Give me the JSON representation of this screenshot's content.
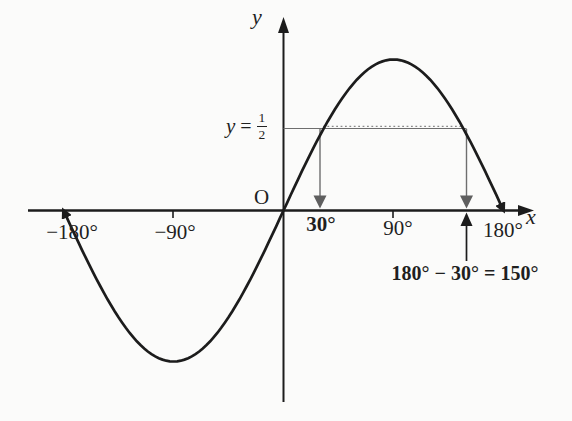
{
  "figure": {
    "background": "#fbfbfa",
    "ink_color": "#1c1c1c",
    "guide_line_color": "#6e6e6e",
    "guide_arrow_color": "#5f5f5f",
    "labels": {
      "y_axis": "y",
      "x_axis": "x",
      "origin": "O",
      "half_line_y": "y",
      "half_line_eq": "=",
      "half_num": "1",
      "half_den": "2",
      "tick_neg180": "−180°",
      "tick_neg90": "−90°",
      "tick_30": "30°",
      "tick_90": "90°",
      "tick_180": "180°",
      "solution": "180° − 30° = 150°"
    }
  },
  "chart_data": {
    "type": "line",
    "series": [
      {
        "name": "sin(x)",
        "description": "one full period of the sine curve"
      }
    ],
    "x_unit": "degrees",
    "x_range": [
      -180,
      180
    ],
    "y_range": [
      -1,
      1
    ],
    "x_ticks": [
      -180,
      -90,
      0,
      90,
      180
    ],
    "x_tick_labels": [
      "−180°",
      "−90°",
      "O",
      "90°",
      "180°"
    ],
    "highlight_y_value": 0.5,
    "highlight_y_label": "y = 1/2",
    "solutions_deg": [
      30,
      150
    ],
    "annotation": "180° − 30° = 150°",
    "grid": false,
    "legend": false,
    "layout": {
      "origin_px": [
        283.5,
        210.5
      ],
      "px_per_90deg": 110,
      "amplitude_px": 151,
      "curve_domain_deg": [
        -180,
        180
      ],
      "curve_sample_step_deg": 3
    }
  }
}
